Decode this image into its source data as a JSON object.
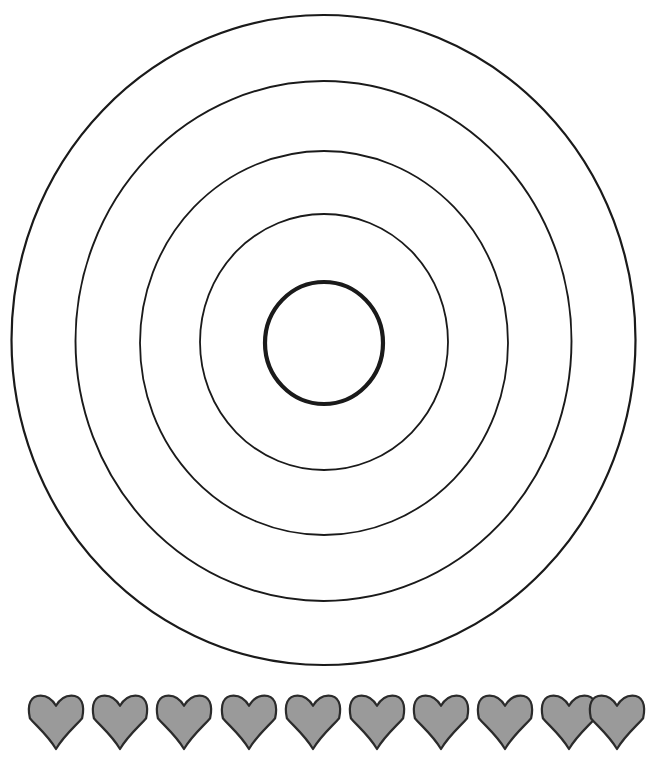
{
  "canvas": {
    "width": 647,
    "height": 759,
    "background_color": "#ffffff"
  },
  "target": {
    "name": "concentric-rings-target",
    "center_x": 323.5,
    "center_y": 340,
    "ring_count": 5,
    "ring_stroke_color": "#1a1a1a",
    "ring_fill": "none",
    "rings": [
      {
        "index": 1,
        "label": "outer-ring-1",
        "rx": 312,
        "ry": 325,
        "cx": 323.5,
        "cy": 340,
        "stroke_width": 2.2
      },
      {
        "index": 2,
        "label": "ring-2",
        "rx": 248,
        "ry": 260,
        "cx": 323.5,
        "cy": 341,
        "stroke_width": 1.9
      },
      {
        "index": 3,
        "label": "ring-3",
        "rx": 184,
        "ry": 192,
        "cx": 324,
        "cy": 343,
        "stroke_width": 1.8
      },
      {
        "index": 4,
        "label": "ring-4",
        "rx": 124,
        "ry": 128,
        "cx": 324,
        "cy": 342,
        "stroke_width": 1.8
      },
      {
        "index": 5,
        "label": "bullseye-inner-ring",
        "rx": 59,
        "ry": 61,
        "cx": 324,
        "cy": 343,
        "stroke_width": 4.2
      }
    ]
  },
  "hearts_row": {
    "name": "hearts-row",
    "count": 10,
    "fill_color": "#9a9a9a",
    "stroke_color": "#2b2b2b",
    "stroke_width": 2.2,
    "heart_width": 55,
    "heart_height": 54,
    "first_center_x": 56,
    "pitch": 64.2,
    "center_y": 722,
    "hearts": [
      {
        "index": 1,
        "cx": 56
      },
      {
        "index": 2,
        "cx": 120
      },
      {
        "index": 3,
        "cx": 184
      },
      {
        "index": 4,
        "cx": 249
      },
      {
        "index": 5,
        "cx": 313
      },
      {
        "index": 6,
        "cx": 377
      },
      {
        "index": 7,
        "cx": 441
      },
      {
        "index": 8,
        "cx": 505
      },
      {
        "index": 9,
        "cx": 569
      },
      {
        "index": 10,
        "cx": 617
      }
    ]
  }
}
